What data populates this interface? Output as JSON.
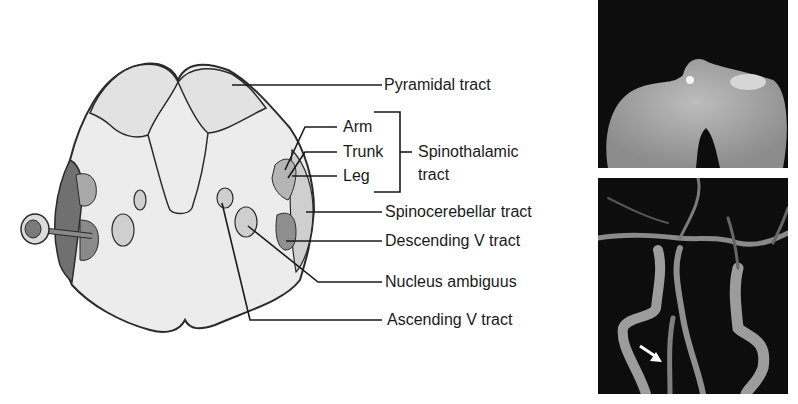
{
  "diagram": {
    "labels": {
      "pyramidal": "Pyramidal tract",
      "arm": "Arm",
      "trunk": "Trunk",
      "leg": "Leg",
      "spinothalamic_line1": "Spinothalamic",
      "spinothalamic_line2": "tract",
      "spinocerebellar": "Spinocerebellar tract",
      "descending_v": "Descending V tract",
      "nucleus_ambiguus": "Nucleus ambiguus",
      "ascending_v": "Ascending V tract"
    },
    "colors": {
      "outline": "#2a2a2a",
      "tissue": "#ececec",
      "light_gray": "#cfcfcf",
      "mid_gray": "#a8a8a8",
      "dark_gray": "#707070"
    }
  },
  "images": {
    "top": {
      "description": "MRI DWI axial medulla lesion"
    },
    "bottom": {
      "description": "MR angiography vertebral arteries",
      "arrow": "white-arrow"
    }
  }
}
